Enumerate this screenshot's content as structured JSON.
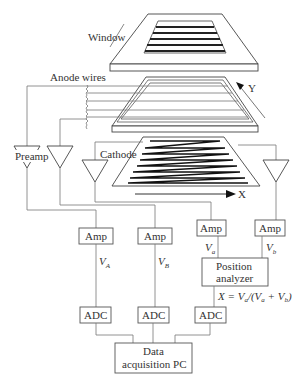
{
  "diagram": {
    "type": "multiwire proportional counter with delay-line readout",
    "labels": {
      "window": "Window",
      "anode": "Anode wires",
      "cathode": "Cathode",
      "preamp": "Preamp",
      "axis_y": "Y",
      "axis_x": "X"
    },
    "boxes": {
      "amp_a": "Amp",
      "amp_b": "Amp",
      "amp_c": "Amp",
      "amp_d": "Amp",
      "adc_1": "ADC",
      "adc_2": "ADC",
      "adc_3": "ADC",
      "analyzer_line1": "Position",
      "analyzer_line2": "analyzer",
      "pc_line1": "Data",
      "pc_line2": "acquisition PC"
    },
    "signals": {
      "va_cap": "V",
      "va_cap_sub": "A",
      "vb_cap": "V",
      "vb_cap_sub": "B",
      "va": "V",
      "va_sub": "a",
      "vb": "V",
      "vb_sub": "b"
    },
    "formula": {
      "lhs": "X = V",
      "sub1": "a",
      "mid": "/(V",
      "sub2": "a",
      "plus": " + V",
      "sub3": "b",
      "end": ")"
    }
  }
}
